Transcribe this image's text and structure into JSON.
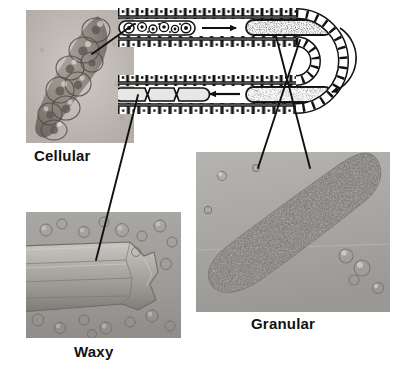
{
  "figure": {
    "background": "#ffffff",
    "ink": "#111111"
  },
  "panels": [
    {
      "id": "cellular",
      "label": "Cellular",
      "kind": "photomicrograph",
      "description": "Cellular cast composed of packed rounded epithelial cells in a cylindrical matrix"
    },
    {
      "id": "waxy",
      "label": "Waxy",
      "kind": "photomicrograph",
      "description": "Waxy cast with smooth homogeneous body, sharp blunt ends and cracked notched margins"
    },
    {
      "id": "granular",
      "label": "Granular",
      "kind": "photomicrograph",
      "description": "Coarsely granular cast, elongated cylinder filled with dense granules"
    }
  ],
  "diagram": {
    "name": "renal-tubule-loop",
    "wall_label": "tubular epithelial cells",
    "segments": [
      {
        "id": "upper-proximal",
        "content": "cellular-cast",
        "description": "Intact cells within tubular lumen forming a cellular cast"
      },
      {
        "id": "upper-distal",
        "content": "granular-cast",
        "description": "Cells degenerate into coarse granules forming a granular cast"
      },
      {
        "id": "lower-distal",
        "content": "granular-cast-fine",
        "description": "Finely granular cast travelling back along the tubule"
      },
      {
        "id": "lower-proximal",
        "content": "waxy-cast",
        "description": "Homogeneous waxy cast with notched edges"
      }
    ],
    "arrows": [
      {
        "id": "arrow-upper",
        "direction": "right",
        "meaning": "cellular cast degenerates to granular"
      },
      {
        "id": "arrow-loop",
        "direction": "curved-down",
        "meaning": "flow around the loop"
      },
      {
        "id": "arrow-lower",
        "direction": "left",
        "meaning": "granular cast degenerates to waxy"
      }
    ]
  },
  "leaders": [
    {
      "id": "leader-cellular",
      "from": "upper-proximal",
      "to": "cellular"
    },
    {
      "id": "leader-waxy",
      "from": "lower-proximal",
      "to": "waxy"
    },
    {
      "id": "leader-granular-upper",
      "from": "upper-distal",
      "to": "granular"
    },
    {
      "id": "leader-granular-lower",
      "from": "lower-distal",
      "to": "granular"
    }
  ]
}
